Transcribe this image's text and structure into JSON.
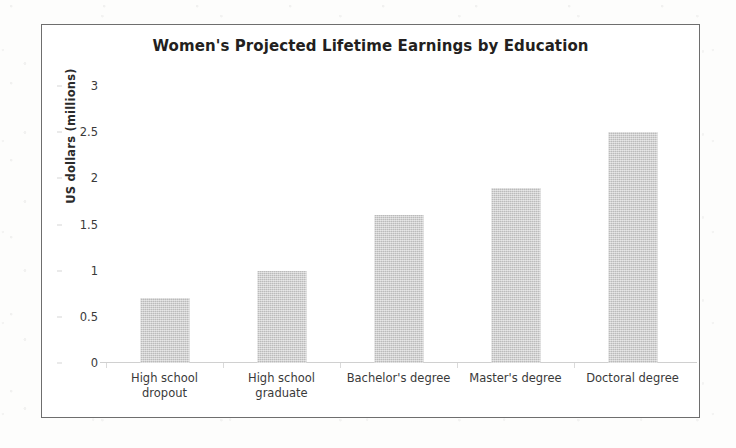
{
  "chart_data": {
    "type": "bar",
    "title": "Women's Projected Lifetime Earnings by Education",
    "xlabel": "",
    "ylabel": "US dollars (millions)",
    "categories": [
      "High school\ndropout",
      "High school\ngraduate",
      "Bachelor's degree",
      "Master's degree",
      "Doctoral degree"
    ],
    "values": [
      0.7,
      1.0,
      1.6,
      1.9,
      2.5
    ],
    "ylim": [
      0,
      3
    ],
    "yticks": [
      "0",
      "0.5",
      "1",
      "1.5",
      "2",
      "2.5",
      "3"
    ],
    "ytick_values": [
      0,
      0.5,
      1,
      1.5,
      2,
      2.5,
      3
    ],
    "grid": false,
    "legend": null,
    "bar_color": "#c9c9c9",
    "frame_color": "#6e6e6e",
    "text_color": "#231f20"
  }
}
